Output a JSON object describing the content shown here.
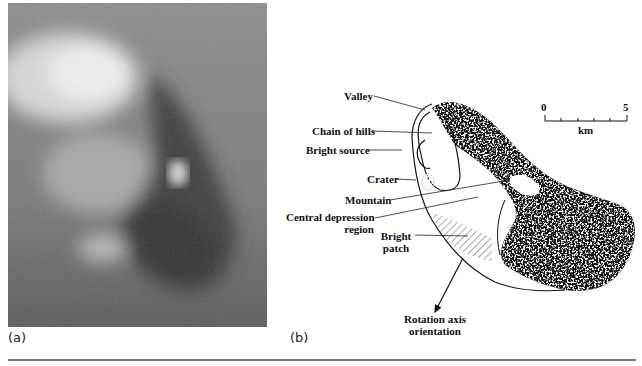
{
  "figure": {
    "panel_a": {
      "label": "(a)"
    },
    "panel_b": {
      "label": "(b)",
      "annotations": {
        "valley": "Valley",
        "chain_of_hills": "Chain of hills",
        "bright_source": "Bright source",
        "crater": "Crater",
        "mountain": "Mountain",
        "central_depression_1": "Central depression",
        "central_depression_2": "region",
        "bright_patch_1": "Bright",
        "bright_patch_2": "patch",
        "rotation_axis_1": "Rotation axis",
        "rotation_axis_2": "orientation"
      },
      "scale_bar": {
        "min": "0",
        "max": "5",
        "unit": "km"
      }
    }
  }
}
